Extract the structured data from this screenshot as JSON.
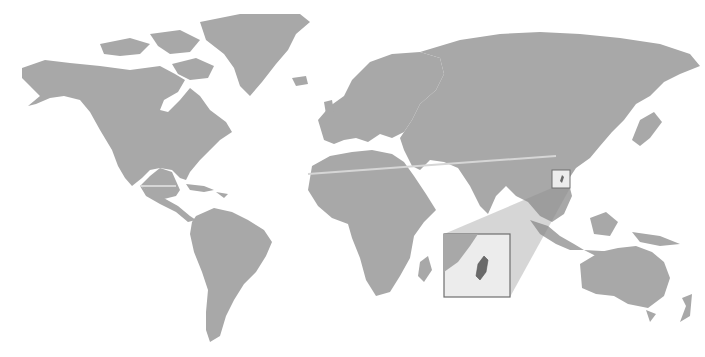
{
  "map": {
    "type": "world-locator",
    "highlighted_region": "Taiwan",
    "colors": {
      "background": "#ffffff",
      "land": "#a8a8a8",
      "highlight_land": "#8f8f8f",
      "zoom_wedge": "#9a9a9a",
      "inset_background": "#ececec",
      "inset_border": "#6e6e6e",
      "tropic_line": "#d6d6d6",
      "target": "#6a6a6a"
    },
    "inset": {
      "label": "Taiwan inset",
      "x": 444,
      "y": 234,
      "width": 66,
      "height": 63
    },
    "locator_box": {
      "x": 552,
      "y": 170,
      "width": 18,
      "height": 18
    }
  }
}
